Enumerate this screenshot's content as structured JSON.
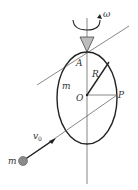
{
  "diagram": {
    "labels": {
      "omega": "ω",
      "A": "A",
      "R": "R",
      "m_ring": "m",
      "O": "O",
      "P": "P",
      "v0_base": "v",
      "v0_sub": "0",
      "m_ball": "m"
    },
    "colors": {
      "stroke": "#222222",
      "thin_line": "#555555",
      "triangle_fill": "#bdbdbd",
      "ball_fill": "#8a8a8a"
    }
  }
}
